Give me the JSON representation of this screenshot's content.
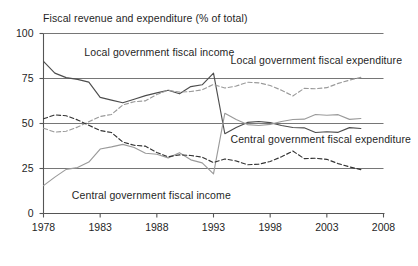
{
  "chart_data": {
    "type": "line",
    "title": "Fiscal revenue and expenditure (% of total)",
    "xlabel": "",
    "ylabel": "",
    "xlim": [
      1978,
      2008
    ],
    "ylim": [
      0,
      100
    ],
    "grid": true,
    "legend_position": "inline-annotations",
    "xticks": [
      "1978",
      "1983",
      "1988",
      "1993",
      "1998",
      "2003",
      "2008"
    ],
    "yticks": [
      "0",
      "25",
      "50",
      "75",
      "100"
    ],
    "x": [
      1978,
      1979,
      1980,
      1981,
      1982,
      1983,
      1984,
      1985,
      1986,
      1987,
      1988,
      1989,
      1990,
      1991,
      1992,
      1993,
      1994,
      1995,
      1996,
      1997,
      1998,
      1999,
      2000,
      2001,
      2002,
      2003,
      2004,
      2005,
      2006
    ],
    "series": [
      {
        "name": "Local government fiscal income",
        "style": "solid",
        "color": "#4d4d4d",
        "values": [
          84.5,
          78.0,
          75.5,
          74.5,
          73.0,
          64.5,
          63.0,
          61.5,
          63.5,
          65.5,
          67.0,
          68.5,
          66.5,
          70.5,
          71.5,
          78.0,
          44.3,
          47.8,
          50.6,
          51.1,
          50.5,
          48.9,
          47.8,
          47.6,
          45.0,
          45.4,
          45.1,
          47.7,
          47.2
        ]
      },
      {
        "name": "Local government fiscal expenditure",
        "style": "dashed",
        "color": "#9a9a9a",
        "values": [
          47.4,
          45.2,
          45.7,
          48.0,
          51.0,
          53.9,
          55.0,
          60.3,
          62.1,
          62.6,
          66.1,
          68.5,
          67.4,
          67.8,
          68.7,
          71.7,
          69.7,
          70.8,
          72.9,
          72.6,
          71.1,
          68.5,
          65.3,
          69.5,
          69.3,
          69.9,
          72.3,
          74.1,
          75.6
        ]
      },
      {
        "name": "Central government fiscal income",
        "style": "solid",
        "color": "#9a9a9a",
        "values": [
          15.5,
          20.2,
          24.5,
          25.5,
          28.6,
          35.8,
          37.0,
          38.4,
          36.7,
          33.5,
          32.9,
          30.9,
          33.8,
          29.8,
          28.1,
          22.0,
          55.7,
          52.2,
          49.4,
          48.9,
          49.5,
          51.1,
          52.2,
          52.4,
          55.0,
          54.6,
          54.9,
          52.3,
          52.8
        ]
      },
      {
        "name": "Central government fiscal expenditure",
        "style": "dashed",
        "color": "#333333",
        "values": [
          52.6,
          54.8,
          54.3,
          52.0,
          49.0,
          46.1,
          45.0,
          39.7,
          37.9,
          37.4,
          33.9,
          31.5,
          32.6,
          32.2,
          31.3,
          28.3,
          30.3,
          29.2,
          27.1,
          27.4,
          28.9,
          31.5,
          34.7,
          30.5,
          30.7,
          30.1,
          27.7,
          25.9,
          24.4
        ]
      }
    ],
    "annotations": [
      {
        "text": "Local government fiscal income",
        "x": 1981.6,
        "y": 89
      },
      {
        "text": "Local government fiscal expenditure",
        "x": 1994.5,
        "y": 85
      },
      {
        "text": "Central government fiscal expenditure",
        "x": 1994.5,
        "y": 41
      },
      {
        "text": "Central government fiscal income",
        "x": 1980.5,
        "y": 10
      }
    ]
  },
  "axis": {
    "yticks": [
      {
        "label": "100",
        "value": 100
      },
      {
        "label": "75",
        "value": 75
      },
      {
        "label": "50",
        "value": 50
      },
      {
        "label": "25",
        "value": 25
      },
      {
        "label": "0",
        "value": 0
      }
    ],
    "xticks": [
      {
        "label": "1978",
        "value": 1978
      },
      {
        "label": "1983",
        "value": 1983
      },
      {
        "label": "1988",
        "value": 1988
      },
      {
        "label": "1993",
        "value": 1993
      },
      {
        "label": "1998",
        "value": 1998
      },
      {
        "label": "2003",
        "value": 2003
      },
      {
        "label": "2008",
        "value": 2008
      }
    ]
  },
  "colors": {
    "axis": "#555555",
    "grid": "#666666",
    "dark_solid": "#4d4d4d",
    "dark_dashed": "#333333",
    "light_solid": "#9a9a9a",
    "light_dashed": "#9a9a9a",
    "background": "#ffffff"
  }
}
